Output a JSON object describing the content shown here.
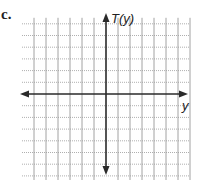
{
  "problem_label": "c.",
  "graph": {
    "y_axis_label": "T(y)",
    "x_axis_label": "y",
    "grid_columns_left": 7,
    "grid_columns_right": 7,
    "grid_rows_above": 6,
    "grid_rows_below": 7,
    "colors": {
      "axis": "#2a2a2a",
      "grid_vertical": "#8a8a8a",
      "grid_horizontal": "#9a9a9a"
    }
  }
}
